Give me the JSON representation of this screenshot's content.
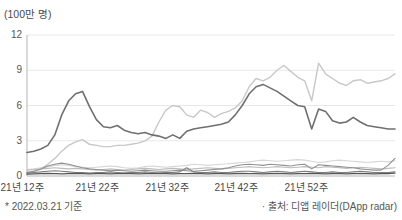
{
  "footnotes": {
    "left": "* 2022.03.21 기준",
    "right": "· 출처: 디앱 레이더(DApp radar)"
  },
  "chart_data": {
    "type": "line",
    "unit_label": "(100만 명)",
    "title": "",
    "legend": "none",
    "grid": "horizontal",
    "grid_color": "#e8e8e8",
    "axis_color": "#b5b5b5",
    "ylim": [
      0,
      12
    ],
    "y_ticks": [
      0,
      3,
      6,
      9,
      12
    ],
    "x_tick_labels": [
      "21년 12주",
      "21년 22주",
      "21년 32주",
      "21년 42주",
      "21년 52주"
    ],
    "x_note": "weekly points, 2021 week 12 through 2022 week ~13",
    "series": [
      {
        "name": "minor-line-light",
        "color": "#d6d6d6",
        "width": 1.1,
        "values": [
          0.55,
          0.6,
          0.7,
          0.8,
          0.9,
          0.95,
          0.9,
          0.8,
          0.75,
          0.7,
          0.75,
          0.8,
          0.85,
          0.8,
          0.7,
          0.65,
          0.7,
          0.8,
          0.85,
          0.8,
          0.75,
          0.8,
          0.85,
          0.9,
          1.0,
          0.95,
          0.9,
          0.95,
          1.0,
          1.05,
          1.1,
          1.15,
          1.2,
          1.3,
          1.35,
          1.3,
          1.25,
          1.3,
          1.35,
          1.4,
          1.35,
          1.25,
          1.15,
          1.2,
          1.3,
          1.35,
          1.3,
          1.25,
          1.2,
          1.15,
          1.2,
          1.25,
          1.2,
          1.3
        ]
      },
      {
        "name": "minor-line-medium-light",
        "color": "#bdbdbd",
        "width": 1.1,
        "values": [
          0.5,
          0.55,
          0.6,
          0.65,
          0.7,
          0.65,
          0.6,
          0.65,
          0.6,
          0.55,
          0.5,
          0.55,
          0.6,
          0.55,
          0.5,
          0.55,
          0.6,
          0.65,
          0.6,
          0.55,
          0.6,
          0.65,
          0.6,
          0.55,
          0.6,
          0.65,
          0.7,
          0.65,
          0.6,
          0.65,
          0.7,
          0.75,
          0.8,
          0.75,
          0.7,
          0.75,
          0.8,
          0.75,
          0.7,
          0.75,
          0.8,
          0.75,
          0.7,
          0.8,
          0.75,
          0.7,
          0.65,
          0.7,
          0.75,
          0.7,
          0.65,
          0.6,
          0.65,
          0.7
        ]
      },
      {
        "name": "main-line-light",
        "color": "#c8c8c8",
        "width": 1.4,
        "values": [
          0.3,
          0.4,
          0.6,
          1.0,
          1.5,
          2.1,
          2.6,
          2.9,
          3.1,
          2.7,
          2.6,
          2.5,
          2.5,
          2.6,
          2.6,
          2.7,
          2.8,
          3.0,
          3.4,
          4.6,
          5.6,
          6.0,
          5.9,
          5.2,
          5.0,
          5.6,
          5.4,
          5.0,
          5.3,
          5.5,
          5.8,
          6.4,
          7.6,
          8.3,
          8.1,
          8.4,
          9.0,
          9.4,
          8.9,
          8.4,
          8.1,
          6.4,
          9.6,
          8.7,
          8.3,
          7.9,
          7.7,
          8.1,
          8.2,
          7.9,
          8.0,
          8.1,
          8.3,
          8.7
        ]
      },
      {
        "name": "minor-line-medium",
        "color": "#909090",
        "width": 1.1,
        "values": [
          0.3,
          0.4,
          0.6,
          0.85,
          1.0,
          1.1,
          1.0,
          0.85,
          0.7,
          0.6,
          0.55,
          0.5,
          0.45,
          0.5,
          0.45,
          0.4,
          0.45,
          0.5,
          0.45,
          0.4,
          0.4,
          0.45,
          0.5,
          0.45,
          0.4,
          0.45,
          0.5,
          0.55,
          0.6,
          0.7,
          0.85,
          0.95,
          1.0,
          0.95,
          0.9,
          1.0,
          0.95,
          0.9,
          0.85,
          0.95,
          1.0,
          0.6,
          0.95,
          0.9,
          0.85,
          0.8,
          0.75,
          0.7,
          0.6,
          0.55,
          0.5,
          0.5,
          0.9,
          1.5
        ]
      },
      {
        "name": "minor-line-dark",
        "color": "#7d7d7d",
        "width": 1.1,
        "values": [
          0.25,
          0.3,
          0.35,
          0.4,
          0.45,
          0.4,
          0.35,
          0.3,
          0.3,
          0.25,
          0.3,
          0.3,
          0.35,
          0.3,
          0.25,
          0.3,
          0.3,
          0.35,
          0.3,
          0.25,
          0.3,
          0.3,
          0.35,
          0.7,
          0.35,
          0.3,
          0.3,
          0.35,
          0.3,
          0.3,
          0.35,
          0.4,
          0.4,
          0.35,
          0.3,
          0.35,
          0.4,
          0.35,
          0.3,
          0.35,
          0.4,
          0.35,
          0.3,
          0.3,
          0.35,
          0.3,
          0.3,
          0.35,
          0.4,
          0.35,
          0.3,
          0.3,
          0.3,
          0.35
        ]
      },
      {
        "name": "minor-line-darkest",
        "color": "#555555",
        "width": 1.2,
        "values": [
          0.15,
          0.18,
          0.2,
          0.22,
          0.2,
          0.18,
          0.2,
          0.22,
          0.2,
          0.18,
          0.2,
          0.2,
          0.18,
          0.2,
          0.22,
          0.2,
          0.18,
          0.2,
          0.2,
          0.22,
          0.2,
          0.18,
          0.2,
          0.2,
          0.22,
          0.2,
          0.18,
          0.2,
          0.2,
          0.18,
          0.2,
          0.22,
          0.2,
          0.2,
          0.18,
          0.2,
          0.22,
          0.2,
          0.18,
          0.2,
          0.2,
          0.22,
          0.2,
          0.18,
          0.2,
          0.2,
          0.18,
          0.2,
          0.22,
          0.2,
          0.18,
          0.2,
          0.2,
          0.25
        ]
      },
      {
        "name": "main-line-dark",
        "color": "#6f6f6f",
        "width": 1.6,
        "values": [
          2.0,
          2.1,
          2.3,
          2.6,
          3.5,
          5.2,
          6.4,
          7.0,
          7.2,
          5.9,
          4.8,
          4.2,
          4.1,
          4.3,
          3.9,
          3.7,
          3.6,
          3.7,
          3.5,
          3.4,
          3.2,
          3.5,
          3.2,
          3.8,
          4.0,
          4.1,
          4.2,
          4.3,
          4.4,
          4.6,
          5.2,
          6.0,
          7.0,
          7.6,
          7.8,
          7.5,
          7.2,
          6.8,
          6.4,
          6.0,
          5.9,
          4.0,
          5.7,
          5.5,
          4.7,
          4.5,
          4.6,
          5.0,
          4.6,
          4.3,
          4.2,
          4.1,
          4.0,
          4.0
        ]
      }
    ]
  }
}
